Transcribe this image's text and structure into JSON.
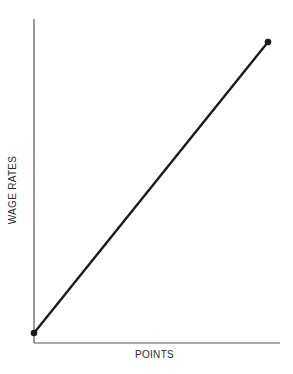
{
  "chart_data": {
    "type": "line",
    "title": "",
    "xlabel": "POINTS",
    "ylabel": "WAGE RATES",
    "x": [
      0,
      1
    ],
    "series": [
      {
        "name": "wage line",
        "values": [
          0,
          1
        ],
        "color": "#1a1a1a",
        "markers": true
      }
    ],
    "xlim": [
      0,
      1.05
    ],
    "ylim": [
      -0.03,
      1.08
    ],
    "grid": false,
    "legend": "none",
    "ticks": "none"
  },
  "colors": {
    "axis": "#555555",
    "line": "#1a1a1a",
    "background": "#ffffff"
  }
}
